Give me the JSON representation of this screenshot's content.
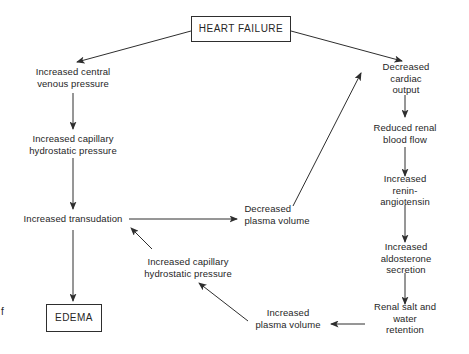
{
  "figure": {
    "background": "#ffffff",
    "line_color": "#2e2e2e",
    "text_color": "#262626",
    "caption_fragment": "f",
    "nodes": [
      {
        "id": "heart-failure",
        "label": "HEART FAILURE",
        "x": 241,
        "y": 29,
        "boxed": true,
        "box_w": 100,
        "box_h": 26
      },
      {
        "id": "increased-central-venous-pressure",
        "label": "Increased central\nvenous pressure",
        "x": 73,
        "y": 77
      },
      {
        "id": "increased-capillary-hydrostatic-pressure-upper",
        "label": "Increased capillary\nhydrostatic pressure",
        "x": 73,
        "y": 144
      },
      {
        "id": "increased-transudation",
        "label": "Increased transudation",
        "x": 73,
        "y": 219
      },
      {
        "id": "edema",
        "label": "EDEMA",
        "x": 74,
        "y": 318,
        "boxed": true,
        "box_w": 56,
        "box_h": 28
      },
      {
        "id": "decreased-plasma-volume",
        "label": "Decreased\nplasma volume",
        "x": 277,
        "y": 214,
        "align": "left"
      },
      {
        "id": "decreased-cardiac-output",
        "label": "Decreased cardiac\noutput",
        "x": 406,
        "y": 78
      },
      {
        "id": "reduced-renal-blood-flow",
        "label": "Reduced renal\nblood flow",
        "x": 405,
        "y": 133
      },
      {
        "id": "increased-renin-angiotensin",
        "label": "Increased renin-\nangiotensin",
        "x": 405,
        "y": 190
      },
      {
        "id": "increased-aldosterone-secretion",
        "label": "Increased aldosterone\nsecretion",
        "x": 406,
        "y": 258
      },
      {
        "id": "renal-salt-and-water-retention",
        "label": "Renal salt and\nwater retention",
        "x": 405,
        "y": 318
      },
      {
        "id": "increased-plasma-volume",
        "label": "Increased\nplasma volume",
        "x": 288,
        "y": 318
      },
      {
        "id": "increased-capillary-hydrostatic-pressure-lower",
        "label": "Increased capillary\nhydrostatic pressure",
        "x": 188,
        "y": 267
      }
    ],
    "edges": [
      {
        "from": "heart-failure",
        "to": "increased-central-venous-pressure",
        "x1": 191,
        "y1": 31,
        "x2": 77,
        "y2": 62
      },
      {
        "from": "heart-failure",
        "to": "decreased-cardiac-output",
        "x1": 291,
        "y1": 31,
        "x2": 402,
        "y2": 61
      },
      {
        "from": "increased-central-venous-pressure",
        "to": "increased-capillary-hydrostatic-pressure-upper",
        "x1": 73,
        "y1": 93,
        "x2": 73,
        "y2": 129
      },
      {
        "from": "increased-capillary-hydrostatic-pressure-upper",
        "to": "increased-transudation",
        "x1": 73,
        "y1": 158,
        "x2": 73,
        "y2": 209
      },
      {
        "from": "increased-transudation",
        "to": "edema",
        "x1": 73,
        "y1": 230,
        "x2": 73,
        "y2": 301
      },
      {
        "from": "increased-transudation",
        "to": "decreased-plasma-volume",
        "x1": 129,
        "y1": 219,
        "x2": 237,
        "y2": 219
      },
      {
        "from": "decreased-plasma-volume",
        "to": "decreased-cardiac-output",
        "x1": 293,
        "y1": 206,
        "x2": 361,
        "y2": 73
      },
      {
        "from": "decreased-cardiac-output",
        "to": "reduced-renal-blood-flow",
        "x1": 405,
        "y1": 95,
        "x2": 405,
        "y2": 117
      },
      {
        "from": "reduced-renal-blood-flow",
        "to": "increased-renin-angiotensin",
        "x1": 405,
        "y1": 147,
        "x2": 405,
        "y2": 176
      },
      {
        "from": "increased-renin-angiotensin",
        "to": "increased-aldosterone-secretion",
        "x1": 405,
        "y1": 205,
        "x2": 405,
        "y2": 242
      },
      {
        "from": "increased-aldosterone-secretion",
        "to": "renal-salt-and-water-retention",
        "x1": 405,
        "y1": 273,
        "x2": 405,
        "y2": 304
      },
      {
        "from": "renal-salt-and-water-retention",
        "to": "increased-plasma-volume",
        "x1": 365,
        "y1": 324,
        "x2": 331,
        "y2": 324
      },
      {
        "from": "increased-plasma-volume",
        "to": "increased-capillary-hydrostatic-pressure-lower",
        "x1": 248,
        "y1": 321,
        "x2": 199,
        "y2": 283
      },
      {
        "from": "increased-capillary-hydrostatic-pressure-lower",
        "to": "increased-transudation",
        "x1": 152,
        "y1": 249,
        "x2": 131,
        "y2": 228
      }
    ]
  }
}
